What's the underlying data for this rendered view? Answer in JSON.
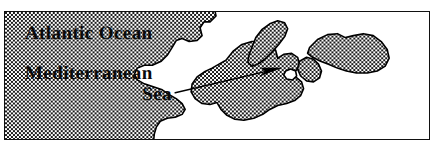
{
  "figure": {
    "kind": "map",
    "frame": {
      "border_color": "#111111",
      "border_width_px": 1.5,
      "x": 4,
      "y": 11,
      "width": 426,
      "height": 129
    }
  },
  "labels": {
    "atlantic_ocean": "Atlantic Ocean",
    "mediterranean": "Mediterranean",
    "sea": "Sea"
  },
  "colors": {
    "land_fill_dark": "#1a1a1a",
    "land_fill_light": "#ffffff",
    "coastline": "#000000",
    "sea_fill": "#ffffff",
    "text": "#0a0a0a",
    "frame_border": "#111111",
    "arrow": "#000000"
  },
  "map_features": {
    "land_description": "Stippled checkerboard-filled landmass surrounding a white sea basin",
    "sea_description": "White unfilled water body representing the Mediterranean Sea and adjoining Atlantic",
    "regions": [
      "Iberian Peninsula",
      "Southern France",
      "Italian Peninsula",
      "Adriatic coast",
      "Balkans and Anatolia",
      "Black Sea region",
      "North African coast"
    ],
    "island_note": "Small white enclosed basin in the eastern-central landmass"
  },
  "annotation_arrow": {
    "label": "pointer-arrow",
    "description": "Thin black arrow pointing east-northeast from the Mediterranean Sea label into the central-eastern sea basin",
    "tail": {
      "x": 175,
      "y": 93
    },
    "head": {
      "x": 281,
      "y": 69
    },
    "direction": "east-northeast"
  }
}
